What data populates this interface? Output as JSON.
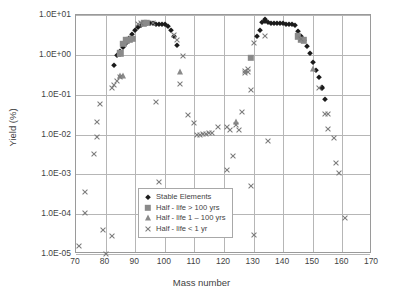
{
  "chart_data": {
    "type": "scatter",
    "title": "",
    "xlabel": "Mass number",
    "ylabel": "Yield (%)",
    "xlim": [
      70,
      170
    ],
    "ylim": [
      1e-05,
      10
    ],
    "yscale": "log",
    "xticks": [
      70,
      80,
      90,
      100,
      110,
      120,
      130,
      140,
      150,
      160,
      170
    ],
    "yticks": [
      1e-05,
      0.0001,
      0.001,
      0.01,
      0.1,
      1,
      10
    ],
    "ytick_labels": [
      "1.0E-05",
      "1.0E-04",
      "1.0E-03",
      "1.0E-02",
      "1.0E-01",
      "1.0E+00",
      "1.0E+01"
    ],
    "grid": true,
    "legend_position": "lower center",
    "series": [
      {
        "name": "Stable Elements",
        "marker": "diamond",
        "color": "#1b1b1b",
        "points": [
          [
            83,
            0.55
          ],
          [
            84,
            1.0
          ],
          [
            85,
            1.05
          ],
          [
            85,
            1.25
          ],
          [
            86,
            1.55
          ],
          [
            87,
            2.0
          ],
          [
            88,
            2.6
          ],
          [
            89,
            3.3
          ],
          [
            90,
            4.3
          ],
          [
            91,
            5.0
          ],
          [
            92,
            5.6
          ],
          [
            93,
            6.2
          ],
          [
            94,
            6.3
          ],
          [
            95,
            6.2
          ],
          [
            96,
            6.2
          ],
          [
            97,
            6.1
          ],
          [
            98,
            6.0
          ],
          [
            99,
            6.0
          ],
          [
            100,
            6.0
          ],
          [
            101,
            5.2
          ],
          [
            102,
            4.2
          ],
          [
            103,
            3.0
          ],
          [
            104,
            1.8
          ],
          [
            131,
            2.9
          ],
          [
            132,
            4.3
          ],
          [
            133,
            6.8
          ],
          [
            134,
            7.8
          ],
          [
            134,
            7.0
          ],
          [
            135,
            6.6
          ],
          [
            136,
            6.3
          ],
          [
            137,
            6.2
          ],
          [
            138,
            6.3
          ],
          [
            139,
            6.4
          ],
          [
            140,
            6.2
          ],
          [
            141,
            6.0
          ],
          [
            142,
            5.9
          ],
          [
            143,
            5.9
          ],
          [
            144,
            5.5
          ],
          [
            145,
            3.9
          ],
          [
            146,
            3.0
          ],
          [
            147,
            2.3
          ],
          [
            148,
            1.7
          ],
          [
            149,
            1.1
          ],
          [
            150,
            0.66
          ],
          [
            151,
            0.42
          ],
          [
            152,
            0.27
          ],
          [
            153,
            0.16
          ],
          [
            153,
            0.15
          ],
          [
            154,
            0.078
          ]
        ]
      },
      {
        "name": "Half - life > 100 yrs",
        "marker": "square",
        "color": "#8a8a8a",
        "points": [
          [
            85,
            1.1
          ],
          [
            86,
            1.9
          ],
          [
            87,
            2.3
          ],
          [
            88,
            2.4
          ],
          [
            89,
            2.5
          ],
          [
            93,
            6.2
          ],
          [
            94,
            6.3
          ],
          [
            129,
            0.85
          ],
          [
            145,
            2.9
          ],
          [
            146,
            2.4
          ],
          [
            147,
            2.3
          ]
        ]
      },
      {
        "name": "Half - life 1 – 100 yrs",
        "marker": "triangle",
        "color": "#8a8a8a",
        "points": [
          [
            85,
            0.29
          ],
          [
            86,
            0.29
          ],
          [
            105,
            0.38
          ],
          [
            124,
            0.021
          ],
          [
            150,
            0.45
          ]
        ]
      },
      {
        "name": "Half - life < 1 yr",
        "marker": "x",
        "color": "#7b7b7b",
        "points": [
          [
            71,
            1.6e-05
          ],
          [
            73,
            0.00036
          ],
          [
            73,
            0.00011
          ],
          [
            76,
            0.0033
          ],
          [
            77,
            0.0086
          ],
          [
            77,
            0.021
          ],
          [
            78,
            0.057
          ],
          [
            79,
            4.1e-05
          ],
          [
            80,
            1e-05
          ],
          [
            82,
            2.9e-05
          ],
          [
            82,
            0.15
          ],
          [
            83,
            0.18
          ],
          [
            84,
            0.22
          ],
          [
            85,
            0.28
          ],
          [
            91,
            6.0
          ],
          [
            92,
            6.2
          ],
          [
            96,
            6.3
          ],
          [
            97,
            0.064
          ],
          [
            98,
            0.00063
          ],
          [
            103,
            3.2
          ],
          [
            104,
            2.4
          ],
          [
            105,
            0.19
          ],
          [
            106,
            0.93
          ],
          [
            108,
            0.03
          ],
          [
            110,
            0.019
          ],
          [
            111,
            0.01
          ],
          [
            112,
            0.01
          ],
          [
            113,
            0.0105
          ],
          [
            114,
            0.0105
          ],
          [
            115,
            0.011
          ],
          [
            116,
            0.011
          ],
          [
            118,
            0.015
          ],
          [
            121,
            0.015
          ],
          [
            121,
            0.0013
          ],
          [
            122,
            0.013
          ],
          [
            123,
            0.0029
          ],
          [
            124,
            0.017
          ],
          [
            125,
            0.013
          ],
          [
            126,
            0.036
          ],
          [
            127,
            0.36
          ],
          [
            127,
            0.4
          ],
          [
            128,
            0.43
          ],
          [
            128,
            0.37
          ],
          [
            129,
            0.13
          ],
          [
            129,
            0.0005
          ],
          [
            130,
            2.0
          ],
          [
            130,
            3e-05
          ],
          [
            134,
            3.0
          ],
          [
            135,
            0.007
          ],
          [
            146,
            2.5
          ],
          [
            152,
            0.15
          ],
          [
            154,
            0.033
          ],
          [
            155,
            0.032
          ],
          [
            155,
            0.014
          ],
          [
            157,
            0.008
          ],
          [
            158,
            0.0019
          ],
          [
            159,
            0.00105
          ],
          [
            161,
            8e-05
          ]
        ]
      }
    ]
  },
  "axis": {
    "x_title": "Mass number",
    "y_title": "Yield (%)"
  },
  "legend": {
    "entries": [
      {
        "label": "Stable Elements",
        "marker": "diamond"
      },
      {
        "label": "Half - life > 100 yrs",
        "marker": "square"
      },
      {
        "label": "Half - life 1 – 100 yrs",
        "marker": "triangle"
      },
      {
        "label": "Half - life < 1 yr",
        "marker": "x"
      }
    ]
  },
  "colors": {
    "stable": "#1b1b1b",
    "halflife_gray": "#8a8a8a",
    "x_marker": "#7b7b7b",
    "grid": "#b6b6b6",
    "frame": "#9a9a9a",
    "text": "#3f3f3f"
  }
}
